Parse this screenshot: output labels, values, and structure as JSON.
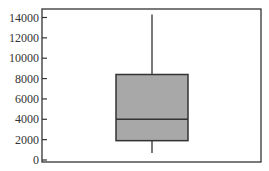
{
  "chart_data": {
    "type": "box",
    "title": "",
    "xlabel": "",
    "ylabel": "",
    "ylim": [
      0,
      14000
    ],
    "yticks": [
      0,
      2000,
      4000,
      6000,
      8000,
      10000,
      12000,
      14000
    ],
    "ytick_labels": [
      "0",
      "2000",
      "4000",
      "6000",
      "8000",
      "10000",
      "12000",
      "14000"
    ],
    "grid": false,
    "legend": null,
    "series": [
      {
        "name": "",
        "whisker_low": 700,
        "q1": 1900,
        "median": 4000,
        "q3": 8400,
        "whisker_high": 14300
      }
    ],
    "colors": {
      "box_fill": "#a8a8a8",
      "box_stroke": "#333333",
      "axis": "#333333"
    }
  }
}
